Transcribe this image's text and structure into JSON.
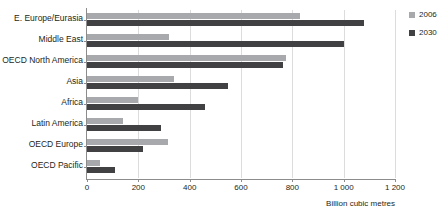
{
  "chart_data": {
    "type": "bar",
    "orientation": "horizontal",
    "title": "",
    "xlabel": "Billion cubic metres",
    "ylabel": "",
    "xlim": [
      0,
      1200
    ],
    "grid": true,
    "legend_position": "right",
    "categories": [
      "E. Europe/Eurasia",
      "Middle East",
      "OECD North America",
      "Asia",
      "Africa",
      "Latin America",
      "OECD Europe",
      "OECD Pacific"
    ],
    "series": [
      {
        "name": "2006",
        "color": "#a7a9ac",
        "values": [
          830,
          320,
          775,
          340,
          200,
          140,
          315,
          50
        ]
      },
      {
        "name": "2030",
        "color": "#414042",
        "values": [
          1080,
          1000,
          765,
          550,
          460,
          290,
          220,
          110
        ]
      }
    ],
    "x_ticks": [
      {
        "value": 0,
        "label": "0"
      },
      {
        "value": 200,
        "label": "200"
      },
      {
        "value": 400,
        "label": "400"
      },
      {
        "value": 600,
        "label": "600"
      },
      {
        "value": 800,
        "label": "800"
      },
      {
        "value": 1000,
        "label": "1 000"
      },
      {
        "value": 1200,
        "label": "1 200"
      }
    ]
  },
  "legend": {
    "items": [
      {
        "label": "2006",
        "color": "#a7a9ac"
      },
      {
        "label": "2030",
        "color": "#414042"
      }
    ]
  },
  "axis": {
    "x_title": "Billion cubic metres"
  }
}
